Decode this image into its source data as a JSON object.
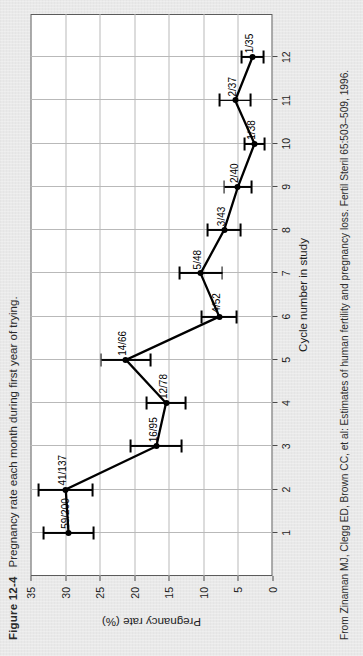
{
  "figure": {
    "number": "Figure 12-4",
    "caption": "Pregnancy rate each month during first year of trying.",
    "source": "From Zinaman MJ, Clegg ED, Brown CC, et al: Estimates of human fertility and pregnancy loss. Fertil Steril 65:503–509, 1996."
  },
  "chart_data": {
    "type": "line",
    "title": "",
    "xlabel": "Cycle number in study",
    "ylabel": "Pregnancy rate (%)",
    "xlim": [
      0,
      13
    ],
    "ylim": [
      0,
      35
    ],
    "xticks": [
      1,
      2,
      3,
      4,
      5,
      6,
      7,
      8,
      9,
      10,
      11,
      12
    ],
    "yticks": [
      0,
      5,
      10,
      15,
      20,
      25,
      30,
      35
    ],
    "grid": true,
    "legend": "none",
    "x": [
      1,
      2,
      3,
      4,
      5,
      6,
      7,
      8,
      9,
      10,
      11,
      12
    ],
    "values": [
      29.5,
      29.9,
      16.8,
      15.4,
      21.2,
      7.7,
      10.4,
      7.0,
      5.0,
      2.6,
      5.4,
      2.9
    ],
    "point_labels": [
      "59/200",
      "41/137",
      "16/95",
      "12/78",
      "14/66",
      "4/52",
      "5/48",
      "3/43",
      "2/40",
      "1/38",
      "2/37",
      "1/35"
    ],
    "error_low": [
      25.9,
      26.0,
      13.1,
      12.6,
      17.6,
      5.2,
      7.3,
      4.6,
      3.0,
      1.2,
      3.2,
      1.3
    ],
    "error_high": [
      33.1,
      33.8,
      20.5,
      18.2,
      24.8,
      10.2,
      13.5,
      9.4,
      7.0,
      4.0,
      7.6,
      4.5
    ],
    "colors": {
      "series": "#000000",
      "grid": "#b9b9b9",
      "axis": "#5b5b5b",
      "plot_bg": "#ffffff"
    }
  }
}
